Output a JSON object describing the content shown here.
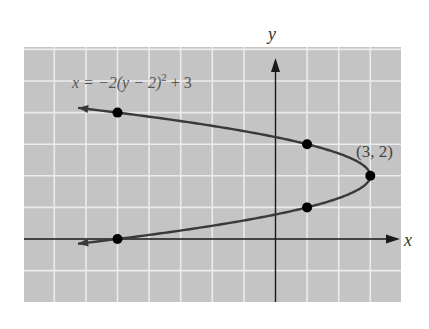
{
  "chart_data": {
    "type": "line",
    "title": "",
    "equation_label": "x = −2(y − 2)² + 3",
    "xlabel": "x",
    "ylabel": "y",
    "xlim": [
      -7.8,
      4.0
    ],
    "ylim": [
      -2.0,
      6.0
    ],
    "grid": true,
    "grid_step": 1,
    "vertex": {
      "x": 3,
      "y": 2,
      "label": "(3, 2)"
    },
    "points": [
      {
        "x": -5,
        "y": 4
      },
      {
        "x": 1,
        "y": 3
      },
      {
        "x": 3,
        "y": 2
      },
      {
        "x": 1,
        "y": 1
      },
      {
        "x": -5,
        "y": 0
      }
    ],
    "curve": {
      "a": -2,
      "k": 2,
      "h": 3,
      "y_range": [
        -0.15,
        4.15
      ]
    }
  },
  "colors": {
    "panel": "#c4c4c4",
    "grid": "#ececec",
    "axis": "#1a1a1a",
    "curve": "#3a3a3a",
    "point": "#000000",
    "text": "#555555"
  }
}
